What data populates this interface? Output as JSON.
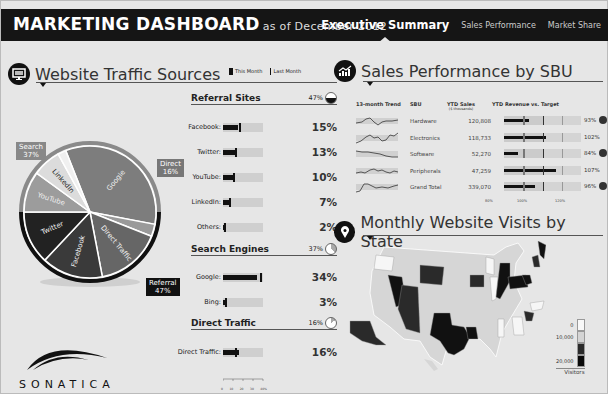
{
  "header": {
    "title": "MARKETING DASHBOARD",
    "subtitle": "as of December 2012",
    "tabs": [
      {
        "label": "Executive Summary",
        "active": true
      },
      {
        "label": "Sales Performance",
        "active": false
      },
      {
        "label": "Market Share",
        "active": false
      }
    ]
  },
  "traffic": {
    "title": "Website Traffic Sources",
    "icon": "monitor-icon",
    "legend": {
      "this_month": "This Month",
      "last_month": "Last Month"
    },
    "groups": [
      {
        "name": "Referral Sites",
        "pct": "47%",
        "items": [
          {
            "label": "Facebook:",
            "value": "15%",
            "fill": 15,
            "target": 17
          },
          {
            "label": "Twitter:",
            "value": "13%",
            "fill": 13,
            "target": 14
          },
          {
            "label": "YouTube:",
            "value": "10%",
            "fill": 10,
            "target": 12
          },
          {
            "label": "LinkedIn:",
            "value": "7%",
            "fill": 7,
            "target": 7
          },
          {
            "label": "Others:",
            "value": "2%",
            "fill": 2,
            "target": 2
          }
        ]
      },
      {
        "name": "Search Engines",
        "pct": "37%",
        "items": [
          {
            "label": "Google:",
            "value": "34%",
            "fill": 34,
            "target": 36
          },
          {
            "label": "Bing:",
            "value": "3%",
            "fill": 3,
            "target": 2
          }
        ]
      },
      {
        "name": "Direct Traffic",
        "pct": "16%",
        "items": [
          {
            "label": "Direct Traffic:",
            "value": "16%",
            "fill": 16,
            "target": 13
          }
        ]
      }
    ],
    "axis_ticks": [
      "0",
      "10",
      "20",
      "30",
      "40%"
    ],
    "pie": {
      "labels": {
        "search": {
          "name": "Search",
          "pct": "37%",
          "color": "#8a8a8a"
        },
        "direct": {
          "name": "Direct",
          "pct": "16%",
          "color": "#777777"
        },
        "referral": {
          "name": "Referral",
          "pct": "47%",
          "color": "#111111"
        }
      },
      "slices": [
        {
          "name": "Google",
          "value": 34,
          "color": "#7d7d7d"
        },
        {
          "name": "Bing",
          "value": 3,
          "color": "#9a9a9a"
        },
        {
          "name": "Direct Traffic",
          "value": 16,
          "color": "#666666"
        },
        {
          "name": "Facebook",
          "value": 15,
          "color": "#3a3a3a"
        },
        {
          "name": "Twitter",
          "value": 13,
          "color": "#222222"
        },
        {
          "name": "YouTube",
          "value": 10,
          "color": "#9c9c9c"
        },
        {
          "name": "LinkedIn",
          "value": 7,
          "color": "#dcdcdc"
        },
        {
          "name": "Others",
          "value": 2,
          "color": "#f0f0f0"
        }
      ]
    }
  },
  "logo": {
    "text": "SONATICA"
  },
  "sales": {
    "title": "Sales Performance by SBU",
    "icon": "chart-up-icon",
    "columns": {
      "trend": "13-month Trend",
      "sbu": "SBU",
      "ytd_sales": "YTD Sales",
      "ytd_sales_unit": "($ thousands)",
      "rev_target": "YTD Revenue vs. Target"
    },
    "rows": [
      {
        "sbu": "Hardware",
        "sales": "120,808",
        "pct": "93%",
        "ratio": 93,
        "alert": true,
        "spark": "M0,8 L6,7 L10,4 L14,3 L18,7 L22,10 L26,7 L30,6 L36,6 L42,5"
      },
      {
        "sbu": "Electronics",
        "sales": "118,733",
        "pct": "102%",
        "ratio": 102,
        "alert": false,
        "spark": "M0,11 L5,9 L10,5 L14,3 L18,6 L22,5 L26,9 L30,8 L34,3 L38,4 L42,1"
      },
      {
        "sbu": "Software",
        "sales": "52,270",
        "pct": "84%",
        "ratio": 84,
        "alert": true,
        "spark": "M0,3 L6,4 L12,4 L18,5 L24,6 L30,8 L36,9 L42,9"
      },
      {
        "sbu": "Peripherals",
        "sales": "47,259",
        "pct": "107%",
        "ratio": 107,
        "alert": false,
        "spark": "M0,8 L5,7 L9,8 L14,5 L18,4 L22,6 L26,5 L30,7 L34,8 L38,6 L42,7"
      },
      {
        "sbu": "Grand Total",
        "sales": "339,070",
        "pct": "96%",
        "ratio": 96,
        "alert": true,
        "spark": "M0,11 L4,10 L8,3 L12,3 L16,5 L20,7 L26,6 L32,7 L38,5 L42,4"
      }
    ],
    "axis": [
      "80%",
      "100%",
      "120%"
    ]
  },
  "visits": {
    "title": "Monthly Website Visits by State",
    "icon": "map-pin-icon",
    "legend": {
      "labels": [
        "0",
        "10,000",
        "20,000"
      ],
      "caption": "Visitors"
    }
  },
  "colors": {
    "header_bg": "#151515",
    "panel_bg": "#e6e6e6",
    "dark": "#111111"
  }
}
